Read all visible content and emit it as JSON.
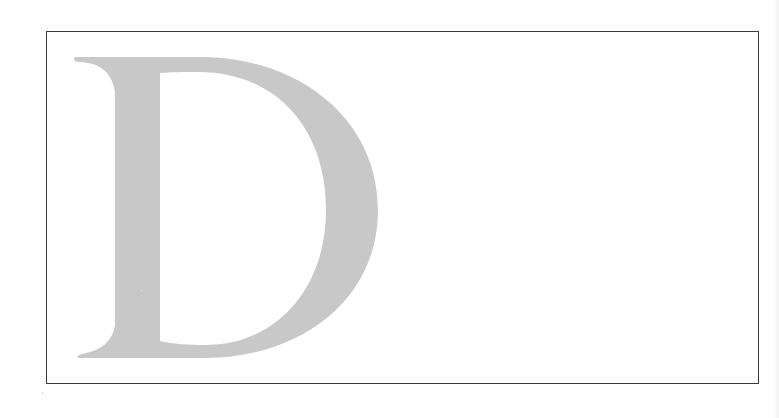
{
  "figure": {
    "letter": "D",
    "letter_color": "#c8c8c8",
    "frame_color": "#3a3a3a",
    "background": "#ffffff"
  }
}
